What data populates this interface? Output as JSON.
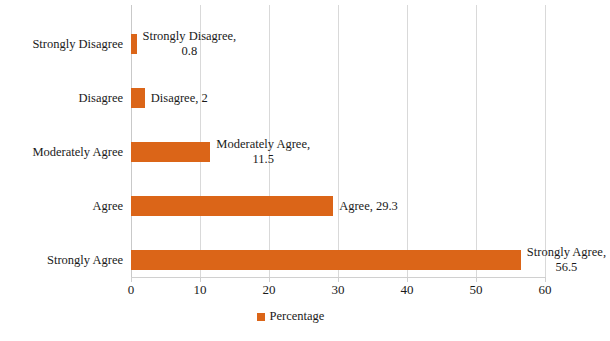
{
  "chart_data": {
    "type": "bar",
    "orientation": "horizontal",
    "title": "",
    "xlabel": "",
    "ylabel": "",
    "xlim": [
      0,
      60
    ],
    "xticks": [
      0,
      10,
      20,
      30,
      40,
      50,
      60
    ],
    "grid": true,
    "legend_position": "bottom",
    "categories": [
      "Strongly Disagree",
      "Disagree",
      "Moderately Agree",
      "Agree",
      "Strongly Agree"
    ],
    "values": [
      0.8,
      2,
      11.5,
      29.3,
      56.5
    ],
    "series": [
      {
        "name": "Percentage",
        "color": "#DB6518",
        "values": [
          0.8,
          2,
          11.5,
          29.3,
          56.5
        ]
      }
    ],
    "data_labels": [
      "Strongly Disagree,\n0.8",
      "Disagree, 2",
      "Moderately Agree,\n11.5",
      "Agree, 29.3",
      "Strongly Agree,\n56.5"
    ]
  },
  "axis": {
    "tick_labels": [
      "0",
      "10",
      "20",
      "30",
      "40",
      "50",
      "60"
    ]
  },
  "legend": {
    "entries": [
      {
        "label": "Percentage",
        "color": "#DB6518"
      }
    ]
  },
  "colors": {
    "bar": "#DB6518",
    "gridline": "#D9D9D9",
    "text": "#1A1A1A",
    "background": "#FFFFFF"
  }
}
